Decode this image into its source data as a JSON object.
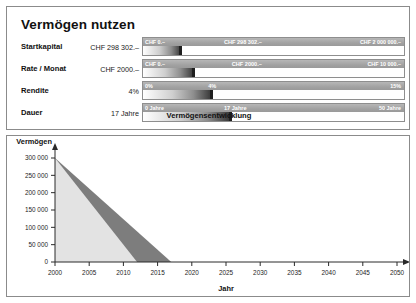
{
  "app": {
    "title": "Vermögen nutzen"
  },
  "controls": {
    "rows": [
      {
        "label": "Startkapital",
        "value": "CHF 298 302.–",
        "min_label": "CHF 0.–",
        "max_label": "CHF 2 000 000.–",
        "current_label": "CHF 298 302.–",
        "fill_percent": 14.9,
        "min": 0,
        "max": 2000000,
        "value_number": 298302
      },
      {
        "label": "Rate / Monat",
        "value": "CHF 2000.–",
        "min_label": "CHF 0.–",
        "max_label": "CHF 10 000.–",
        "current_label": "CHF 2000.–",
        "fill_percent": 20,
        "min": 0,
        "max": 10000,
        "value_number": 2000
      },
      {
        "label": "Rendite",
        "value": "4%",
        "min_label": "0%",
        "max_label": "15%",
        "current_label": "4%",
        "fill_percent": 26.7,
        "min": 0,
        "max": 15,
        "value_number": 4
      },
      {
        "label": "Dauer",
        "value": "17 Jahre",
        "min_label": "0 Jahre",
        "max_label": "50 Jahre",
        "current_label": "17 Jahre",
        "fill_percent": 34,
        "min": 0,
        "max": 50,
        "value_number": 17
      }
    ],
    "caption": "Vermögensentwicklung"
  },
  "chart_data": {
    "type": "area",
    "title": "Vermögensentwicklung",
    "xlabel": "Jahr",
    "ylabel": "Vermögen",
    "xlim": [
      2000,
      2050
    ],
    "ylim": [
      0,
      300000
    ],
    "xticks": [
      2000,
      2005,
      2010,
      2015,
      2020,
      2025,
      2030,
      2035,
      2040,
      2045,
      2050
    ],
    "xtick_labels": [
      "2000",
      "2005",
      "2010",
      "2015",
      "2020",
      "2025",
      "2030",
      "2035",
      "2040",
      "2045",
      "2050"
    ],
    "yticks": [
      0,
      50000,
      100000,
      150000,
      200000,
      250000,
      300000
    ],
    "ytick_labels": [
      "0",
      "50 000",
      "100 000",
      "150 000",
      "200 000",
      "250 000",
      "300 000"
    ],
    "grid": false,
    "legend": "none",
    "series": [
      {
        "name": "Vermögen ohne Rendite",
        "color": "#7d7d7d",
        "x": [
          2000,
          2017
        ],
        "values": [
          300000,
          0
        ]
      },
      {
        "name": "Vermögen mit Kapitalverzehr",
        "color": "#e3e3e3",
        "x": [
          2000,
          2012
        ],
        "values": [
          300000,
          0
        ]
      }
    ]
  },
  "colors": {
    "panel_border": "#8b8b8b",
    "slider_scale": "#a2a2a2",
    "slider_handle": "#1f1f1f",
    "area_dark": "#7d7d7d",
    "area_light": "#e3e3e3",
    "axis": "#2a2a2a"
  }
}
